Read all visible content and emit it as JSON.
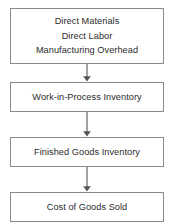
{
  "diagram": {
    "type": "flowchart",
    "orientation": "vertical",
    "colors": {
      "background": "#ffffff",
      "box_border": "#8a8a8a",
      "box_fill": "#ffffff",
      "text": "#2b2b2b",
      "arrow": "#555555"
    },
    "nodes": [
      {
        "id": "inputs",
        "lines": [
          "Direct Materials",
          "Direct Labor",
          "Manufacturing Overhead"
        ]
      },
      {
        "id": "wip",
        "lines": [
          "Work-in-Process Inventory"
        ]
      },
      {
        "id": "finished_goods",
        "lines": [
          "Finished Goods Inventory"
        ]
      },
      {
        "id": "cogs",
        "lines": [
          "Cost of Goods Sold"
        ]
      }
    ],
    "arrows": [
      {
        "from": "inputs",
        "to": "wip",
        "label": ""
      },
      {
        "from": "wip",
        "to": "finished_goods",
        "label": ""
      },
      {
        "from": "finished_goods",
        "to": "cogs",
        "label": ""
      }
    ]
  }
}
